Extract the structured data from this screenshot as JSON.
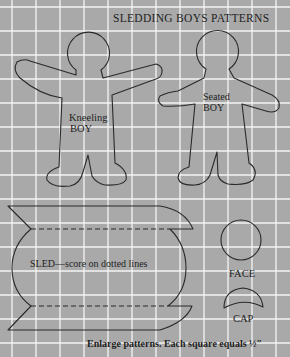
{
  "title": "SLEDDING BOYS PATTERNS",
  "grid": {
    "spacing_px": 24,
    "offset_x": 12,
    "offset_y": 7,
    "background_color": "#a9a9a9",
    "line_color": "#f4f4f4"
  },
  "patterns": {
    "kneeling_boy": {
      "line1": "Kneeling",
      "line2": "BOY"
    },
    "seated_boy": {
      "line1": "Seated",
      "line2": "BOY"
    },
    "sled": {
      "label": "SLED—score on dotted lines"
    },
    "face": {
      "label": "FACE"
    },
    "cap": {
      "label": "CAP"
    }
  },
  "caption": "Enlarge patterns. Each square equals ½″"
}
